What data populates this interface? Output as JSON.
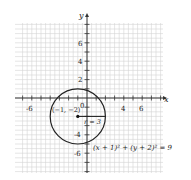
{
  "diagram": {
    "type": "circle-on-coordinate-grid",
    "axes": {
      "x_label": "x",
      "y_label": "y",
      "x_tick_labels": [
        "-6",
        "4",
        "6"
      ],
      "y_tick_labels": [
        "6",
        "4",
        "2",
        "-4",
        "-6"
      ],
      "origin_label": "0",
      "range": {
        "x": [
          -7,
          8
        ],
        "y": [
          -8,
          8
        ]
      }
    },
    "circle": {
      "center": [
        -1,
        -2
      ],
      "radius": 3,
      "center_label": "(−1, −2)",
      "radius_label": "r = 3",
      "equation": "(x + 1)² + (y + 2)² = 9"
    },
    "colors": {
      "grid": "#cfcfcf",
      "axis": "#333333",
      "curve": "#222222"
    }
  }
}
